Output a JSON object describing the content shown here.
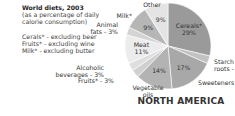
{
  "chart_data": {
    "type": "pie",
    "title": "World diets, 2003",
    "subtitle": "(as a percentage of daily calorie consumption)",
    "notes": [
      "Cerals* - excluding beer",
      "Fruits* - excluding wine",
      "Milk* - excluding butter"
    ],
    "region": "NORTH AMERICA",
    "slices": [
      {
        "label": "Cereals*",
        "value": 29,
        "value_text": "29%",
        "color": "#9a9a9a",
        "label_inside": true
      },
      {
        "label": "Starch roots -",
        "value": 3,
        "value_text": "",
        "color": "#c2c2c2",
        "label_inside": false
      },
      {
        "label": "Sweeteners",
        "value": 17,
        "value_text": "17%",
        "color": "#a8a8a8",
        "label_inside": false
      },
      {
        "label": "Vegetable oils",
        "value": 14,
        "value_text": "14%",
        "color": "#b3b3b3",
        "label_inside": false
      },
      {
        "label": "Fruits* - 3%",
        "value": 3,
        "value_text": "",
        "color": "#cfcfcf",
        "label_inside": false
      },
      {
        "label": "Alcoholic beverages - 3%",
        "value": 3,
        "value_text": "",
        "color": "#dedede",
        "label_inside": false
      },
      {
        "label": "Meat",
        "value": 11,
        "value_text": "11%",
        "color": "#ececec",
        "label_inside": true
      },
      {
        "label": "Animal fats - 3%",
        "value": 3,
        "value_text": "",
        "color": "#d4d4d4",
        "label_inside": false
      },
      {
        "label": "Milk*",
        "value": 9,
        "value_text": "9%",
        "color": "#b6b6b6",
        "label_inside": false
      },
      {
        "label": "Other",
        "value": 9,
        "value_text": "9%",
        "color": "#e4e4e4",
        "label_inside": false
      }
    ]
  }
}
